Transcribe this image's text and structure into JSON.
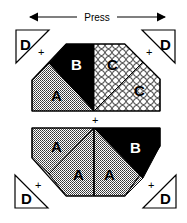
{
  "header": {
    "press_label": "Press"
  },
  "top_unit": {
    "pieces": [
      {
        "label": "A",
        "fill": "grid"
      },
      {
        "label": "B",
        "fill": "black"
      },
      {
        "label": "C",
        "fill": "circles"
      },
      {
        "label": "C",
        "fill": "circles"
      }
    ],
    "corners": [
      {
        "label": "D",
        "position": "top-left"
      },
      {
        "label": "D",
        "position": "top-right"
      }
    ]
  },
  "bottom_unit": {
    "pieces": [
      {
        "label": "A",
        "fill": "grid"
      },
      {
        "label": "A",
        "fill": "grid"
      },
      {
        "label": "A",
        "fill": "grid"
      },
      {
        "label": "B",
        "fill": "black"
      }
    ],
    "corners": [
      {
        "label": "D",
        "position": "bottom-left"
      },
      {
        "label": "D",
        "position": "bottom-right"
      }
    ]
  },
  "markers": {
    "plus": "+"
  },
  "colors": {
    "stroke": "#000000",
    "grid_fill": "#9a9a9a",
    "black_fill": "#000000",
    "background": "#ffffff"
  }
}
